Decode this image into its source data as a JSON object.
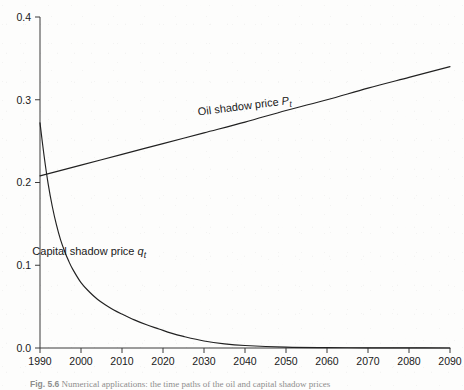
{
  "figure": {
    "caption_number": "Fig. 5.6",
    "caption_text": "Numerical applications: the time paths of the oil and capital shadow prices"
  },
  "chart_data": {
    "type": "line",
    "title": "",
    "xlabel": "",
    "ylabel": "",
    "xlim": [
      1990,
      2090
    ],
    "ylim": [
      0.0,
      0.4
    ],
    "grid": false,
    "legend_position": "inline-annotations",
    "x_ticks": [
      1990,
      2000,
      2010,
      2020,
      2030,
      2040,
      2050,
      2060,
      2070,
      2080,
      2090
    ],
    "x_tick_labels": [
      "1990",
      "2000",
      "2010",
      "2020",
      "2030",
      "2040",
      "2050",
      "2060",
      "2070",
      "2080",
      "2090"
    ],
    "y_ticks": [
      0.0,
      0.1,
      0.2,
      0.3,
      0.4
    ],
    "y_tick_labels": [
      "0.0",
      "0.1",
      "0.2",
      "0.3",
      "0.4"
    ],
    "series": [
      {
        "name": "Oil shadow price P_t",
        "label_text": "Oil  shadow price ",
        "label_var": "P",
        "label_sub": "t",
        "color": "#212121",
        "x": [
          1990,
          2000,
          2010,
          2020,
          2030,
          2040,
          2050,
          2060,
          2070,
          2080,
          2090
        ],
        "values": [
          0.208,
          0.221,
          0.234,
          0.247,
          0.26,
          0.273,
          0.287,
          0.3,
          0.314,
          0.327,
          0.34
        ]
      },
      {
        "name": "Capital shadow price q_t",
        "label_text": "Capital shadow price ",
        "label_var": "q",
        "label_sub": "t",
        "color": "#212121",
        "x": [
          1990,
          1991,
          1992,
          1993,
          1994,
          1995,
          1996,
          1997,
          1998,
          2000,
          2002,
          2004,
          2006,
          2008,
          2010,
          2013,
          2016,
          2019,
          2022,
          2025,
          2030,
          2035,
          2040,
          2050,
          2060,
          2070,
          2080,
          2090
        ],
        "values": [
          0.272,
          0.232,
          0.198,
          0.171,
          0.149,
          0.131,
          0.117,
          0.105,
          0.095,
          0.079,
          0.068,
          0.059,
          0.052,
          0.046,
          0.041,
          0.034,
          0.028,
          0.023,
          0.018,
          0.014,
          0.0085,
          0.005,
          0.003,
          0.001,
          0.0004,
          0.0002,
          0.0001,
          0.0
        ]
      }
    ],
    "annotations": [
      {
        "series": "Oil shadow price P_t",
        "x_at": 2040,
        "y_at": 0.288,
        "rotation_deg": -7.2
      },
      {
        "series": "Capital shadow price q_t",
        "x_at": 2002,
        "y_at": 0.112,
        "rotation_deg": 0
      }
    ]
  }
}
